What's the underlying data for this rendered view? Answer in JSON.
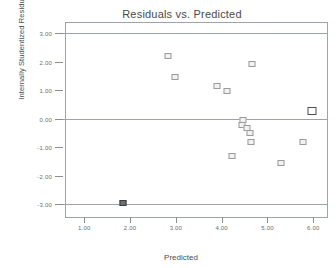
{
  "chart_data": {
    "type": "scatter",
    "title": "Residuals vs. Predicted",
    "xlabel": "Predicted",
    "ylabel": "Internally Studentized Residuals",
    "xlim": [
      0.6,
      6.3
    ],
    "ylim": [
      -3.45,
      3.35
    ],
    "grid": false,
    "legend": "none",
    "xticks": [
      "1.00",
      "2.00",
      "3.00",
      "4.00",
      "5.00",
      "6.00"
    ],
    "xtick_values": [
      1.0,
      2.0,
      3.0,
      4.0,
      5.0,
      6.0
    ],
    "yticks": [
      "3.00",
      "2.00",
      "1.00",
      "0.00",
      "-1.00",
      "-2.00",
      "-3.00"
    ],
    "ytick_values": [
      3.0,
      2.0,
      1.0,
      0.0,
      -1.0,
      -2.0,
      -3.0
    ],
    "reference_lines": [
      {
        "y": 3.0,
        "label": "upper limit"
      },
      {
        "y": 0.0,
        "label": "zero line"
      },
      {
        "y": -3.0,
        "label": "lower limit"
      }
    ],
    "points": [
      {
        "x": 1.85,
        "y": -2.96,
        "style": "filled"
      },
      {
        "x": 2.82,
        "y": 2.18,
        "style": "open"
      },
      {
        "x": 2.98,
        "y": 1.45,
        "style": "open"
      },
      {
        "x": 3.9,
        "y": 1.13,
        "style": "open"
      },
      {
        "x": 4.12,
        "y": 0.98,
        "style": "open"
      },
      {
        "x": 4.22,
        "y": -1.32,
        "style": "open"
      },
      {
        "x": 4.46,
        "y": -0.05,
        "style": "open"
      },
      {
        "x": 4.44,
        "y": -0.22,
        "style": "open"
      },
      {
        "x": 4.55,
        "y": -0.33,
        "style": "open"
      },
      {
        "x": 4.62,
        "y": -0.51,
        "style": "open"
      },
      {
        "x": 4.66,
        "y": 1.93,
        "style": "open"
      },
      {
        "x": 4.65,
        "y": -0.83,
        "style": "open"
      },
      {
        "x": 5.3,
        "y": -1.55,
        "style": "open"
      },
      {
        "x": 5.78,
        "y": -0.82,
        "style": "open"
      },
      {
        "x": 5.98,
        "y": 0.25,
        "style": "emph"
      }
    ]
  }
}
